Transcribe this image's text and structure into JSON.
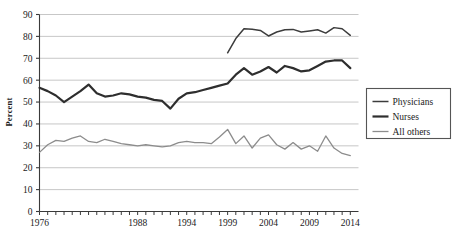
{
  "chart_data": {
    "type": "line",
    "title": "",
    "xlabel": "",
    "ylabel": "Percent",
    "xlim": [
      1976,
      2015
    ],
    "ylim": [
      0,
      90
    ],
    "ytick_step": 10,
    "grid": true,
    "grid_axis": "y",
    "legend_position": "right",
    "xticks": [
      1976,
      1988,
      1994,
      1999,
      2004,
      2009,
      2014
    ],
    "xtick_labels": [
      "1976",
      "1988",
      "1994",
      "1999",
      "2004",
      "2009",
      "2014"
    ],
    "yticks": [
      0,
      10,
      20,
      30,
      40,
      50,
      60,
      70,
      80,
      90
    ],
    "ytick_labels": [
      "0",
      "10",
      "20",
      "30",
      "40",
      "50",
      "60",
      "70",
      "80",
      "90"
    ],
    "series": [
      {
        "name": "Physicians",
        "color": "#3c3c3c",
        "width": 1.5,
        "x": [
          1999,
          2000,
          2001,
          2002,
          2003,
          2004,
          2005,
          2006,
          2007,
          2008,
          2009,
          2010,
          2011,
          2012,
          2013,
          2014
        ],
        "values": [
          72.5,
          79.0,
          83.5,
          83.3,
          82.7,
          80.2,
          82.0,
          83.0,
          83.2,
          82.0,
          82.5,
          83.0,
          81.5,
          84.0,
          83.5,
          80.5
        ]
      },
      {
        "name": "Nurses",
        "color": "#2e2e2e",
        "width": 2.2,
        "x": [
          1976,
          1977,
          1978,
          1979,
          1980,
          1981,
          1982,
          1983,
          1984,
          1985,
          1986,
          1987,
          1988,
          1989,
          1990,
          1991,
          1992,
          1993,
          1994,
          1995,
          1996,
          1997,
          1998,
          1999,
          2000,
          2001,
          2002,
          2003,
          2004,
          2005,
          2006,
          2007,
          2008,
          2009,
          2010,
          2011,
          2012,
          2013,
          2014
        ],
        "values": [
          56.5,
          55.0,
          53.0,
          50.0,
          52.5,
          55.0,
          58.0,
          54.0,
          52.5,
          53.0,
          54.0,
          53.5,
          52.5,
          52.0,
          51.0,
          50.5,
          47.0,
          51.5,
          54.0,
          54.5,
          55.5,
          56.5,
          57.5,
          58.5,
          62.5,
          65.5,
          62.5,
          64.0,
          66.0,
          63.5,
          66.5,
          65.5,
          64.0,
          64.5,
          66.5,
          68.5,
          69.0,
          69.0,
          65.5
        ]
      },
      {
        "name": "All others",
        "color": "#8c8c8c",
        "width": 1.3,
        "x": [
          1976,
          1977,
          1978,
          1979,
          1980,
          1981,
          1982,
          1983,
          1984,
          1985,
          1986,
          1987,
          1988,
          1989,
          1990,
          1991,
          1992,
          1993,
          1994,
          1995,
          1996,
          1997,
          1998,
          1999,
          2000,
          2001,
          2002,
          2003,
          2004,
          2005,
          2006,
          2007,
          2008,
          2009,
          2010,
          2011,
          2012,
          2013,
          2014
        ],
        "values": [
          27.0,
          30.5,
          32.5,
          32.0,
          33.5,
          34.5,
          32.0,
          31.5,
          33.0,
          32.0,
          31.0,
          30.5,
          30.0,
          30.5,
          30.0,
          29.5,
          30.0,
          31.5,
          32.0,
          31.5,
          31.5,
          31.0,
          34.0,
          37.5,
          31.0,
          34.5,
          29.0,
          33.5,
          35.0,
          30.5,
          28.5,
          31.5,
          28.5,
          30.0,
          27.5,
          34.5,
          29.0,
          26.5,
          25.5
        ]
      }
    ],
    "legend": [
      {
        "label": "Physicians",
        "color": "#3c3c3c",
        "width": 1.5
      },
      {
        "label": "Nurses",
        "color": "#2e2e2e",
        "width": 2.2
      },
      {
        "label": "All others",
        "color": "#8c8c8c",
        "width": 1.3
      }
    ],
    "style": {
      "grid_color": "#b9b9b9",
      "axis_color": "#3a3a3a",
      "background": "#ffffff",
      "legend_border": "#555555"
    }
  }
}
